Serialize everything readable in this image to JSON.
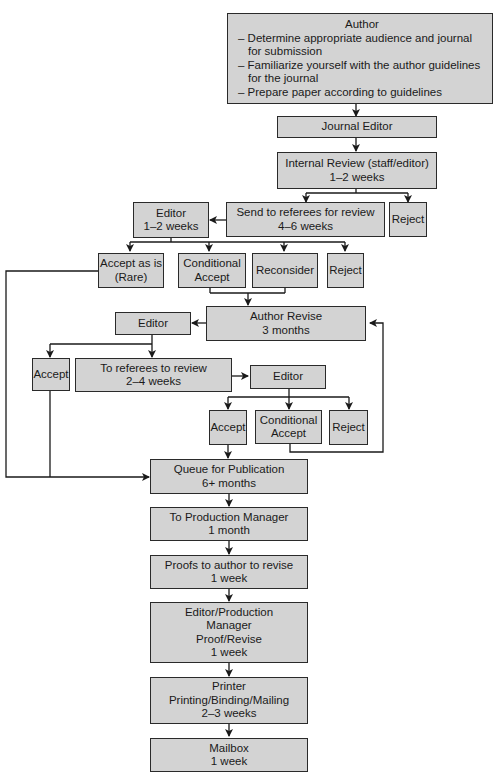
{
  "diagram": {
    "type": "flowchart",
    "colors": {
      "box_fill": "#d3d3d3",
      "box_border": "#2a2a2a",
      "line": "#1a1a1a",
      "background": "#ffffff"
    },
    "nodes": {
      "author": {
        "title": "Author",
        "items": [
          "– Determine appropriate audience and journal for submission",
          "– Familiarize yourself with the author guidelines for the journal",
          "– Prepare paper according to guidelines"
        ]
      },
      "journal_editor": {
        "line1": "Journal Editor"
      },
      "internal_review": {
        "line1": "Internal Review (staff/editor)",
        "line2": "1–2 weeks"
      },
      "send_referees": {
        "line1": "Send to referees for review",
        "line2": "4–6 weeks"
      },
      "reject_1": {
        "line1": "Reject"
      },
      "editor_1": {
        "line1": "Editor",
        "line2": "1–2 weeks"
      },
      "accept_as_is": {
        "line1": "Accept as is",
        "line2": "(Rare)"
      },
      "conditional_accept_1": {
        "line1": "Conditional",
        "line2": "Accept"
      },
      "reconsider": {
        "line1": "Reconsider"
      },
      "reject_2": {
        "line1": "Reject"
      },
      "author_revise": {
        "line1": "Author Revise",
        "line2": "3 months"
      },
      "editor_2": {
        "line1": "Editor"
      },
      "accept_1": {
        "line1": "Accept"
      },
      "to_referees": {
        "line1": "To referees to review",
        "line2": "2–4 weeks"
      },
      "editor_3": {
        "line1": "Editor"
      },
      "accept_2": {
        "line1": "Accept"
      },
      "conditional_accept_2": {
        "line1": "Conditional",
        "line2": "Accept"
      },
      "reject_3": {
        "line1": "Reject"
      },
      "queue": {
        "line1": "Queue for Publication",
        "line2": "6+ months"
      },
      "production_manager": {
        "line1": "To Production Manager",
        "line2": "1 month"
      },
      "proofs": {
        "line1": "Proofs to author to revise",
        "line2": "1 week"
      },
      "editor_production": {
        "line1": "Editor/Production",
        "line2": "Manager",
        "line3": "Proof/Revise",
        "line4": "1 week"
      },
      "printer": {
        "line1": "Printer",
        "line2": "Printing/Binding/Mailing",
        "line3": "2–3 weeks"
      },
      "mailbox": {
        "line1": "Mailbox",
        "line2": "1 week"
      }
    }
  }
}
